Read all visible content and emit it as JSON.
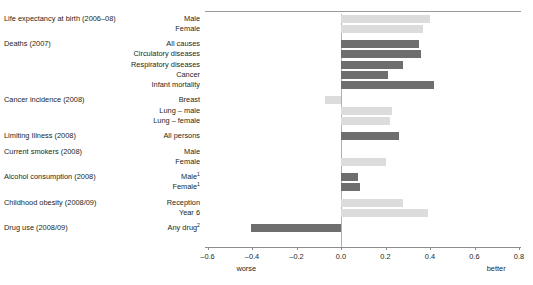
{
  "chart_data": {
    "type": "bar",
    "title": "",
    "subtitle": "",
    "xlabel": "",
    "ylabel": "",
    "orientation": "horizontal",
    "xlim": [
      -0.6,
      0.8
    ],
    "xticks": [
      -0.6,
      -0.4,
      -0.2,
      0.0,
      0.2,
      0.4,
      0.6,
      0.8
    ],
    "xtick_labels": [
      "–0.6",
      "–0.4",
      "–0.2",
      "0.0",
      "0.2",
      "0.4",
      "0.6",
      "0.8"
    ],
    "grid": false,
    "legend_position": "none",
    "axis_end_labels": {
      "left": "worse",
      "right": "better"
    },
    "colors": {
      "dark": "#6e6e6e",
      "light": "#dcdcdc",
      "axis": "#8c8c8c",
      "zero_line": "#b0b0b0",
      "text": "#231f20"
    },
    "groups": [
      {
        "group_label": "Life expectancy at birth (2006–08)",
        "items": [
          {
            "label": "Male",
            "value": 0.4,
            "shade": "light"
          },
          {
            "label": "Female",
            "value": 0.37,
            "shade": "light"
          }
        ]
      },
      {
        "group_label": "Deaths (2007)",
        "items": [
          {
            "label": "All causes",
            "value": 0.35,
            "shade": "dark"
          },
          {
            "label": "Circulatory diseases",
            "value": 0.36,
            "shade": "dark"
          },
          {
            "label": "Respiratory diseases",
            "value": 0.28,
            "shade": "dark"
          },
          {
            "label": "Cancer",
            "value": 0.21,
            "shade": "dark"
          },
          {
            "label": "Infant mortality",
            "value": 0.42,
            "shade": "dark"
          }
        ]
      },
      {
        "group_label": "Cancer incidence (2008)",
        "items": [
          {
            "label": "Breast",
            "value": -0.07,
            "shade": "light"
          },
          {
            "label": "Lung – male",
            "value": 0.23,
            "shade": "light"
          },
          {
            "label": "Lung – female",
            "value": 0.22,
            "shade": "light"
          }
        ]
      },
      {
        "group_label": "Limiting Illness (2008)",
        "items": [
          {
            "label": "All persons",
            "value": 0.26,
            "shade": "dark"
          }
        ]
      },
      {
        "group_label": "Current smokers (2008)",
        "items": [
          {
            "label": "Male",
            "value": 0.0,
            "shade": "light"
          },
          {
            "label": "Female",
            "value": 0.2,
            "shade": "light"
          }
        ]
      },
      {
        "group_label": "Alcohol consumption (2008)",
        "items": [
          {
            "label": "Male",
            "footnote": "1",
            "value": 0.075,
            "shade": "dark"
          },
          {
            "label": "Female",
            "footnote": "1",
            "value": 0.085,
            "shade": "dark"
          }
        ]
      },
      {
        "group_label": "Childhood obesity (2008/09)",
        "items": [
          {
            "label": "Reception",
            "value": 0.28,
            "shade": "light"
          },
          {
            "label": "Year 6",
            "value": 0.39,
            "shade": "light"
          }
        ]
      },
      {
        "group_label": "Drug use (2008/09)",
        "items": [
          {
            "label": "Any drug",
            "footnote": "2",
            "value": -0.405,
            "shade": "dark"
          }
        ]
      }
    ]
  }
}
